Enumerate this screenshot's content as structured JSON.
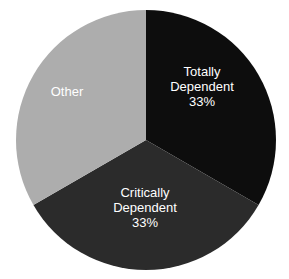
{
  "chart_data": {
    "type": "pie",
    "title": "",
    "subtitle": "",
    "xlabel": "",
    "ylabel": "",
    "grid": false,
    "legend_position": "none",
    "labels_inside_slices": true,
    "start_angle_deg": 0,
    "direction": "clockwise",
    "categories": [
      "Totally Dependent",
      "Critically Dependent",
      "Other"
    ],
    "values": [
      33,
      33,
      34
    ],
    "value_unit": "%",
    "slices": [
      {
        "label": "Totally Dependent",
        "label_line1": "Totally",
        "label_line2": "Dependent",
        "value": 33,
        "value_text": "33%",
        "color": "#0d0d0d",
        "text_color": "#ffffff",
        "start_deg": 0,
        "end_deg": 120
      },
      {
        "label": "Critically Dependent",
        "label_line1": "Critically",
        "label_line2": "Dependent",
        "value": 33,
        "value_text": "33%",
        "color": "#2b2b2b",
        "text_color": "#ffffff",
        "start_deg": 120,
        "end_deg": 240
      },
      {
        "label": "Other",
        "label_line1": "Other",
        "label_line2": "",
        "value": 34,
        "value_text": "",
        "color": "#adadad",
        "text_color": "#ffffff",
        "start_deg": 240,
        "end_deg": 360
      }
    ],
    "geometry": {
      "center_x": 146,
      "center_y": 140,
      "radius": 130
    },
    "colors": {
      "background": "#ffffff",
      "totally_dependent": "#0d0d0d",
      "critically_dependent": "#2b2b2b",
      "other": "#adadad",
      "label_text": "#ffffff"
    }
  }
}
